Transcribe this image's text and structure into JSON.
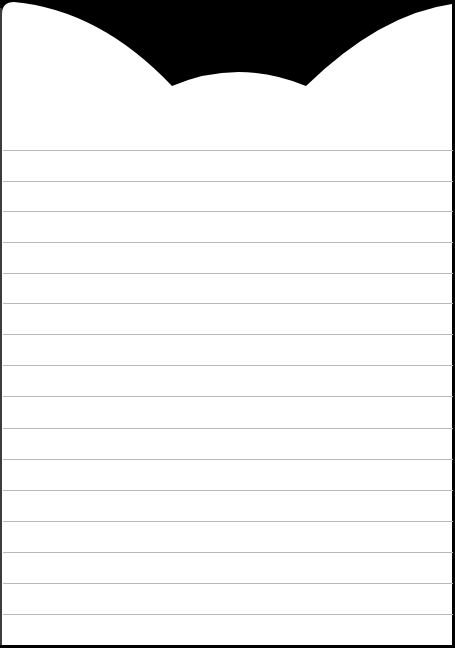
{
  "canvas": {
    "width": 455,
    "height": 648,
    "background_color": "#000000"
  },
  "note_paper": {
    "paper_color": "#ffffff",
    "line_color": "#b9b9b9",
    "top_shape": "scalloped-cat-ear",
    "ruled_line_y": [
      150,
      181,
      211,
      242,
      273,
      303,
      334,
      365,
      396,
      428,
      459,
      490,
      521,
      552,
      583,
      614
    ]
  }
}
